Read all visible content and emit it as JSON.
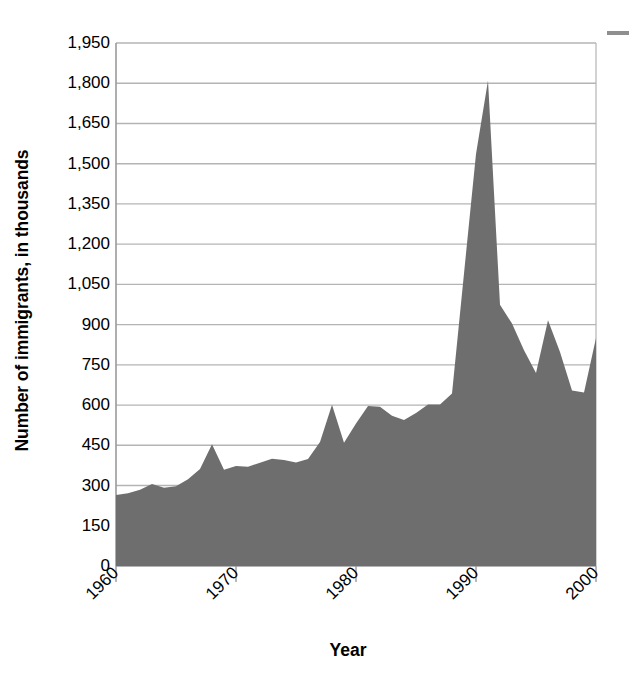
{
  "chart_data": {
    "type": "area",
    "title": "",
    "xlabel": "Year",
    "ylabel": "Number of immigrants, in thousands",
    "xlim": [
      1960,
      2000
    ],
    "ylim": [
      0,
      1950
    ],
    "grid": true,
    "legend": null,
    "fill_color": "#6e6e6e",
    "gridline_color": "#b4b4b4",
    "axis_color": "#9a9a9a",
    "ytick_labels": [
      "1,950",
      "1,800",
      "1,650",
      "1,500",
      "1,350",
      "1,200",
      "1,050",
      "900",
      "750",
      "600",
      "450",
      "300",
      "150",
      "0"
    ],
    "ytick_values": [
      1950,
      1800,
      1650,
      1500,
      1350,
      1200,
      1050,
      900,
      750,
      600,
      450,
      300,
      150,
      0
    ],
    "xtick_labels": [
      "1960",
      "1970",
      "1980",
      "1990",
      "2000"
    ],
    "xtick_values": [
      1960,
      1970,
      1980,
      1990,
      2000
    ],
    "x": [
      1960,
      1961,
      1962,
      1963,
      1964,
      1965,
      1966,
      1967,
      1968,
      1969,
      1970,
      1971,
      1972,
      1973,
      1974,
      1975,
      1976,
      1977,
      1978,
      1979,
      1980,
      1981,
      1982,
      1983,
      1984,
      1985,
      1986,
      1987,
      1988,
      1989,
      1990,
      1991,
      1992,
      1993,
      1994,
      1995,
      1996,
      1997,
      1998,
      1999,
      2000
    ],
    "values": [
      265,
      271,
      284,
      306,
      292,
      297,
      323,
      362,
      454,
      359,
      373,
      370,
      385,
      400,
      395,
      386,
      399,
      462,
      601,
      460,
      531,
      597,
      594,
      560,
      544,
      570,
      602,
      602,
      643,
      1091,
      1536,
      1810,
      974,
      904,
      804,
      720,
      916,
      798,
      654,
      647,
      850
    ],
    "annotations": [
      {
        "text": "peak",
        "x": 1991,
        "y": 1810
      }
    ]
  },
  "axis_title": {
    "y": "Number of immigrants, in thousands",
    "x": "Year"
  },
  "marks": {
    "top_right_dash": "dash-mark"
  }
}
